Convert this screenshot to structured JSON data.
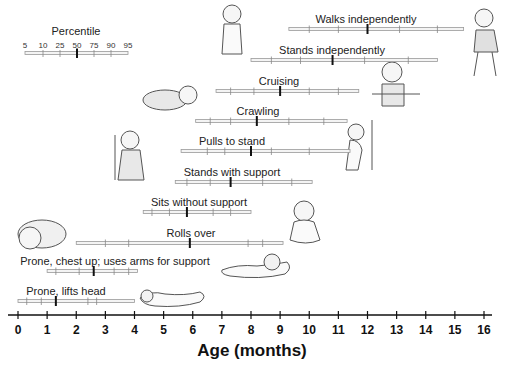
{
  "chart_data": {
    "type": "range-percentile",
    "title": "",
    "xlabel": "Age (months)",
    "ylabel": "",
    "xlim": [
      0,
      16
    ],
    "x_ticks": [
      0,
      1,
      2,
      3,
      4,
      5,
      6,
      7,
      8,
      9,
      10,
      11,
      12,
      13,
      14,
      15,
      16
    ],
    "grid": false,
    "legend": {
      "title": "Percentile",
      "labels": [
        "5",
        "10",
        "25",
        "50",
        "75",
        "90",
        "95"
      ],
      "position": "top-left"
    },
    "percentiles": [
      5,
      10,
      25,
      50,
      75,
      90,
      95
    ],
    "milestones": [
      {
        "name": "Walks independently",
        "values": [
          9.3,
          10.0,
          11.0,
          12.0,
          13.1,
          14.4,
          15.3
        ]
      },
      {
        "name": "Stands independently",
        "values": [
          8.0,
          8.7,
          9.7,
          10.8,
          11.9,
          13.4,
          14.4
        ]
      },
      {
        "name": "Cruising",
        "values": [
          6.8,
          7.3,
          8.1,
          9.0,
          10.0,
          11.0,
          11.7
        ]
      },
      {
        "name": "Crawling",
        "values": [
          6.1,
          6.6,
          7.3,
          8.2,
          9.3,
          10.5,
          11.3
        ]
      },
      {
        "name": "Pulls to stand",
        "values": [
          5.6,
          6.5,
          7.1,
          8.0,
          8.7,
          10.0,
          11.4
        ]
      },
      {
        "name": "Stands with support",
        "values": [
          5.4,
          5.8,
          6.6,
          7.3,
          8.4,
          9.4,
          10.1
        ]
      },
      {
        "name": "Sits without support",
        "values": [
          4.3,
          4.6,
          5.2,
          5.8,
          6.7,
          7.3,
          8.0
        ]
      },
      {
        "name": "Rolls over",
        "values": [
          2.0,
          3.0,
          3.8,
          5.9,
          7.9,
          8.4,
          9.1
        ]
      },
      {
        "name": "Prone, chest up; uses arms for support",
        "values": [
          1.0,
          1.3,
          2.1,
          2.6,
          3.3,
          3.8,
          4.1
        ]
      },
      {
        "name": "Prone, lifts head",
        "values": [
          0.0,
          0.3,
          0.8,
          1.3,
          2.4,
          2.7,
          4.0
        ]
      }
    ]
  },
  "colors": {
    "bar_fill": "#f4f4f4",
    "bar_stroke": "#9a9a9a",
    "tick": "#888888",
    "median": "#111111",
    "axis": "#111111",
    "illustration": "#555555"
  }
}
